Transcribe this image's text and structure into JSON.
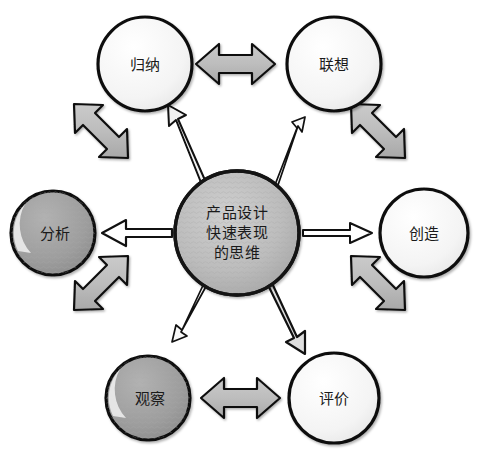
{
  "diagram": {
    "title_text": "产品设计快速表现的思维",
    "background_color": "#ffffff",
    "hub": {
      "id": "hub",
      "lines": [
        "产品设计",
        "快速表现",
        "的思维"
      ],
      "cx": 237,
      "cy": 233,
      "r": 62,
      "fill": "#b6b6b6",
      "stroke": "#141414"
    },
    "nodes": [
      {
        "id": "guina",
        "label": "归纳",
        "cx": 145,
        "cy": 64,
        "r": 47,
        "fill": "#f5f5f5",
        "stroke": "#111111",
        "shaded": false
      },
      {
        "id": "lianxiang",
        "label": "联想",
        "cx": 334,
        "cy": 64,
        "r": 47,
        "fill": "#f5f5f5",
        "stroke": "#111111",
        "shaded": false
      },
      {
        "id": "chuangzao",
        "label": "创造",
        "cx": 424,
        "cy": 233,
        "r": 44,
        "fill": "#f5f5f5",
        "stroke": "#111111",
        "shaded": false
      },
      {
        "id": "pingjia",
        "label": "评价",
        "cx": 334,
        "cy": 398,
        "r": 45,
        "fill": "#f5f5f5",
        "stroke": "#111111",
        "shaded": false
      },
      {
        "id": "guancha",
        "label": "观察",
        "cx": 148,
        "cy": 398,
        "r": 42,
        "fill": "#9d9d9d",
        "stroke": "#111111",
        "shaded": true
      },
      {
        "id": "fenxi",
        "label": "分析",
        "cx": 53,
        "cy": 233,
        "r": 42,
        "fill": "#9d9d9d",
        "stroke": "#111111",
        "shaded": true
      }
    ],
    "ring_arrows": [
      {
        "id": "guina-lianxiang",
        "from": "guina",
        "to": "lianxiang",
        "style": "thick-double",
        "fill": "#b9b9b9",
        "stroke": "#111111"
      },
      {
        "id": "lianxiang-chuangzao",
        "from": "lianxiang",
        "to": "chuangzao",
        "style": "thick-double",
        "fill": "#b9b9b9",
        "stroke": "#111111"
      },
      {
        "id": "chuangzao-pingjia",
        "from": "chuangzao",
        "to": "pingjia",
        "style": "thick-double",
        "fill": "#b9b9b9",
        "stroke": "#111111"
      },
      {
        "id": "pingjia-guancha",
        "from": "pingjia",
        "to": "guancha",
        "style": "thick-double",
        "fill": "#b9b9b9",
        "stroke": "#111111"
      },
      {
        "id": "guancha-fenxi",
        "from": "guancha",
        "to": "fenxi",
        "style": "thick-double",
        "fill": "#b9b9b9",
        "stroke": "#111111"
      },
      {
        "id": "fenxi-guina",
        "from": "fenxi",
        "to": "guina",
        "style": "thick-double",
        "fill": "#b9b9b9",
        "stroke": "#111111"
      }
    ],
    "spoke_arrows": [
      {
        "id": "hub-to-guina",
        "from": "hub",
        "to": "guina",
        "style": "outlined-single",
        "fill": "#efefef",
        "stroke": "#111111"
      },
      {
        "id": "hub-to-lianxiang",
        "from": "hub",
        "to": "lianxiang",
        "style": "thin-single",
        "fill": "#f7f7f7",
        "stroke": "#111111"
      },
      {
        "id": "hub-to-chuangzao",
        "from": "hub",
        "to": "chuangzao",
        "style": "thin-single",
        "fill": "#ffffff",
        "stroke": "#111111"
      },
      {
        "id": "hub-to-pingjia",
        "from": "hub",
        "to": "pingjia",
        "style": "outlined-single",
        "fill": "#dcdcdc",
        "stroke": "#111111"
      },
      {
        "id": "hub-to-guancha",
        "from": "hub",
        "to": "guancha",
        "style": "thin-single",
        "fill": "#f7f7f7",
        "stroke": "#111111"
      },
      {
        "id": "hub-to-fenxi",
        "from": "hub",
        "to": "fenxi",
        "style": "outlined-single",
        "fill": "#ffffff",
        "stroke": "#111111"
      }
    ]
  }
}
